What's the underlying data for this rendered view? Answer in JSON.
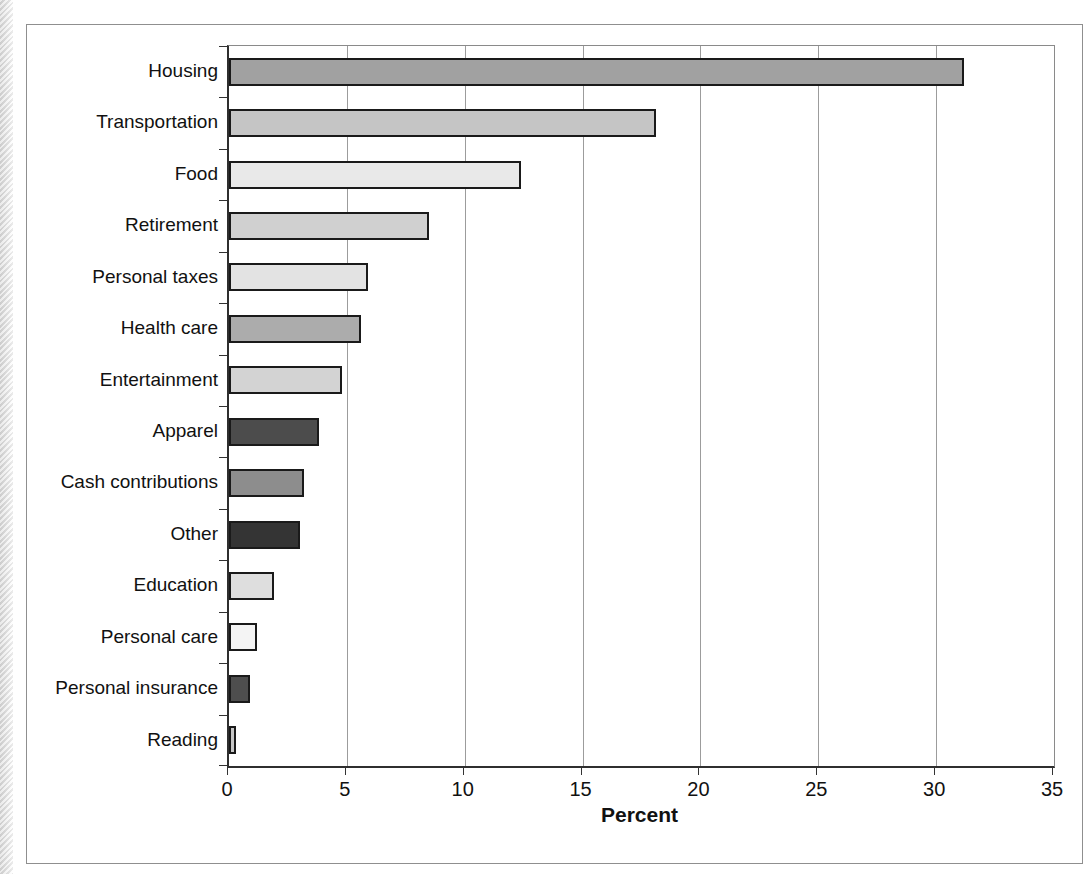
{
  "chart_data": {
    "type": "bar",
    "orientation": "horizontal",
    "title": "",
    "xlabel": "Percent",
    "ylabel": "",
    "xlim": [
      0,
      35
    ],
    "xticks": [
      0,
      5,
      10,
      15,
      20,
      25,
      30,
      35
    ],
    "grid": true,
    "legend_position": "none",
    "categories": [
      "Housing",
      "Transportation",
      "Food",
      "Retirement",
      "Personal taxes",
      "Health care",
      "Entertainment",
      "Apparel",
      "Cash contributions",
      "Other",
      "Education",
      "Personal care",
      "Personal insurance",
      "Reading"
    ],
    "values": [
      31.2,
      18.1,
      12.4,
      8.5,
      5.9,
      5.6,
      4.8,
      3.8,
      3.2,
      3.0,
      1.9,
      1.2,
      0.9,
      0.3
    ],
    "bar_colors": [
      "#a1a1a1",
      "#c5c5c5",
      "#e9e9e9",
      "#d0d0d0",
      "#e3e3e3",
      "#acacac",
      "#d3d3d3",
      "#4c4c4c",
      "#8d8d8d",
      "#343434",
      "#dedede",
      "#f4f4f4",
      "#4e4e4e",
      "#c6c6c6"
    ]
  },
  "colors": {
    "bar_border": "#1a1a1a",
    "axis_line": "#2f2f2f",
    "gridline": "#9c9c9c",
    "frame_border": "#8f8f8f",
    "text": "#111111",
    "page_edge": "#d8d8d8"
  }
}
